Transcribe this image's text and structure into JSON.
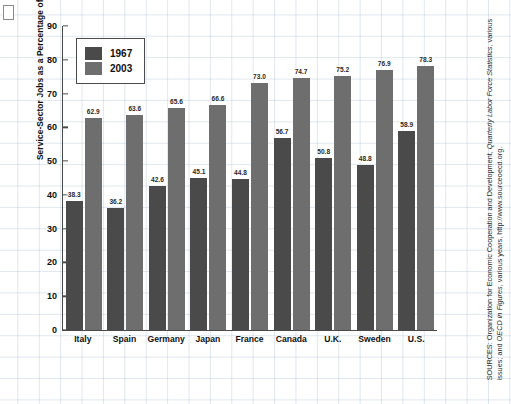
{
  "chart_data": {
    "type": "bar",
    "title": "",
    "xlabel": "",
    "ylabel": "Service-Sector Jobs as a Percentage of the Total Labor Force",
    "ylim": [
      0,
      90
    ],
    "yticks": [
      90,
      80,
      70,
      60,
      50,
      40,
      30,
      20,
      10,
      0
    ],
    "grid": true,
    "legend_position": "upper-left",
    "categories": [
      "Italy",
      "Spain",
      "Germany",
      "Japan",
      "France",
      "Canada",
      "U.K.",
      "Sweden",
      "U.S."
    ],
    "series": [
      {
        "name": "1967",
        "color": "#4a4a4a",
        "values": [
          38.3,
          36.2,
          42.6,
          45.1,
          44.8,
          56.7,
          50.8,
          48.8,
          58.9
        ]
      },
      {
        "name": "2003",
        "color": "#6e6e6e",
        "values": [
          62.9,
          63.6,
          65.6,
          66.6,
          73.0,
          74.7,
          75.2,
          76.9,
          78.3
        ]
      }
    ]
  },
  "legend": {
    "items": [
      {
        "label": "1967"
      },
      {
        "label": "2003"
      }
    ]
  },
  "source": {
    "prefix": "SOURCES: Organization for Economic Cooperation and Development, ",
    "italic1": "Quarterly Labor Force Statistics",
    "middle": ", various issues; and ",
    "italic2": "OECD in Figures",
    "suffix": ", various years, http://www.sourceoecd.org."
  },
  "colors": {
    "series_1967": "#4a4a4a",
    "series_2003": "#6e6e6e",
    "axis": "#4a4a4a",
    "grid": "#96afcd",
    "background": "#ffffff"
  }
}
